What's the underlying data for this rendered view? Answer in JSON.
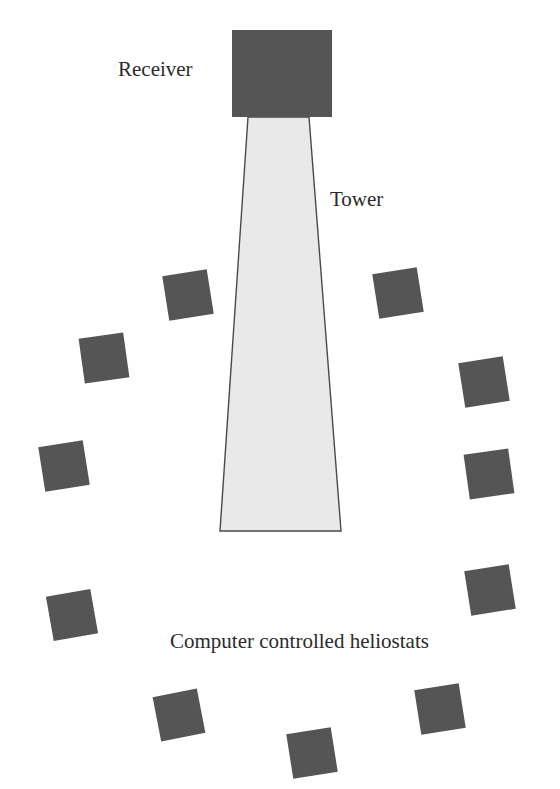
{
  "figure": {
    "width": 560,
    "height": 789,
    "background_color": "#ffffff"
  },
  "labels": {
    "receiver": "Receiver",
    "tower": "Tower",
    "heliostats": "Computer controlled heliostats"
  },
  "colors": {
    "receiver_fill": "#555555",
    "heliostat_fill": "#555555",
    "tower_fill": "#e9e9e9",
    "tower_stroke": "#4a4a4a",
    "text": "#2b2b2b"
  },
  "diagram_data": {
    "type": "diagram",
    "subject": "central receiver solar thermal power plant (power tower)",
    "receiver": {
      "shape": "rectangle",
      "x": 232,
      "y": 30,
      "width": 100,
      "height": 87,
      "fill": "#555555"
    },
    "tower": {
      "shape": "trapezoid",
      "top_left_x": 248,
      "top_right_x": 309,
      "top_y": 117,
      "bottom_left_x": 220,
      "bottom_right_x": 341,
      "bottom_y": 531,
      "fill": "#e9e9e9",
      "stroke": "#4a4a4a"
    },
    "heliostat_count": 12,
    "heliostat_layout": "U-shaped arc surrounding the base of the tower",
    "heliostats": [
      {
        "id": 1,
        "cx": 188,
        "cy": 295,
        "size": 45,
        "rotation": -9
      },
      {
        "id": 2,
        "cx": 104,
        "cy": 358,
        "size": 45,
        "rotation": -8
      },
      {
        "id": 3,
        "cx": 64,
        "cy": 466,
        "size": 45,
        "rotation": -9
      },
      {
        "id": 4,
        "cx": 72,
        "cy": 615,
        "size": 45,
        "rotation": -10
      },
      {
        "id": 5,
        "cx": 179,
        "cy": 715,
        "size": 45,
        "rotation": -11
      },
      {
        "id": 6,
        "cx": 312,
        "cy": 753,
        "size": 45,
        "rotation": -9
      },
      {
        "id": 7,
        "cx": 440,
        "cy": 709,
        "size": 45,
        "rotation": -9
      },
      {
        "id": 8,
        "cx": 490,
        "cy": 590,
        "size": 45,
        "rotation": -9
      },
      {
        "id": 9,
        "cx": 489,
        "cy": 474,
        "size": 45,
        "rotation": -8
      },
      {
        "id": 10,
        "cx": 484,
        "cy": 382,
        "size": 45,
        "rotation": -9
      },
      {
        "id": 11,
        "cx": 398,
        "cy": 293,
        "size": 45,
        "rotation": -9
      },
      {
        "id": 12,
        "cx": 428,
        "cy": 289,
        "size": 0,
        "rotation": 0
      }
    ]
  }
}
